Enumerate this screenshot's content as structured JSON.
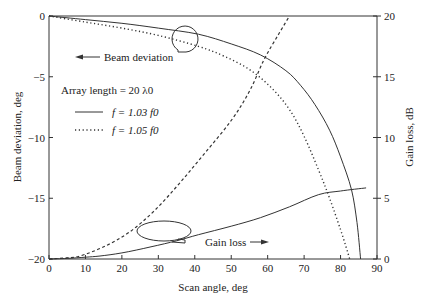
{
  "chart_data": {
    "type": "line",
    "title": "",
    "xlabel": "Scan angle, deg",
    "ylabel": "Beam deviation, deg",
    "y2label": "Gain loss, dB",
    "xlim": [
      0,
      90
    ],
    "ylim": [
      -20,
      0
    ],
    "y2lim": [
      0,
      20
    ],
    "xticks": [
      0,
      10,
      20,
      30,
      40,
      50,
      60,
      70,
      80,
      90
    ],
    "yticks": [
      0,
      -5,
      -10,
      -15,
      -20
    ],
    "y2ticks": [
      20,
      15,
      10,
      5,
      0
    ],
    "grid": false,
    "legend": {
      "title": "Array length = 20 λ0",
      "entries": [
        {
          "label": "f = 1.03 f0",
          "style": "solid"
        },
        {
          "label": "f = 1.05 f0",
          "style": "dotted"
        }
      ],
      "placement": "upper-left"
    },
    "annotations": [
      {
        "text": "Beam deviation",
        "arrow": "left",
        "refers_to": "left-axis"
      },
      {
        "text": "Gain loss",
        "arrow": "right",
        "refers_to": "right-axis"
      }
    ],
    "series": [
      {
        "name": "Beam deviation, f = 1.03 f0",
        "axis": "left",
        "style": "solid",
        "x": [
          0,
          10,
          20,
          30,
          41,
          50,
          58,
          65,
          69,
          73,
          77,
          80,
          83,
          84.5,
          85.5
        ],
        "y": [
          0,
          -0.3,
          -0.6,
          -1.0,
          -1.5,
          -2.3,
          -3.2,
          -4.5,
          -5.7,
          -7.3,
          -9.4,
          -11.6,
          -14.3,
          -17.0,
          -20.0
        ]
      },
      {
        "name": "Beam deviation, f = 1.05 f0",
        "axis": "left",
        "style": "dotted",
        "x": [
          0,
          10,
          20,
          30,
          41,
          48,
          55,
          61,
          66,
          70,
          74,
          77,
          80,
          81.5,
          82.5
        ],
        "y": [
          0,
          -0.5,
          -1.0,
          -1.6,
          -2.5,
          -3.3,
          -4.4,
          -5.9,
          -7.7,
          -9.9,
          -12.7,
          -15.0,
          -17.6,
          -19.0,
          -20.0
        ]
      },
      {
        "name": "Gain loss, f = 1.03 f0",
        "axis": "right",
        "style": "solid",
        "x": [
          0,
          5,
          10,
          14,
          20,
          28,
          35,
          41,
          50,
          58,
          66,
          74,
          80,
          87
        ],
        "y": [
          0,
          0.05,
          0.15,
          0.25,
          0.5,
          1.0,
          1.5,
          2.0,
          2.7,
          3.4,
          4.3,
          5.3,
          5.6,
          5.85
        ]
      },
      {
        "name": "Gain loss, f = 1.05 f0",
        "axis": "right",
        "style": "dashed",
        "x": [
          0,
          5,
          8.5,
          15,
          22,
          29,
          36,
          43,
          50,
          55,
          59,
          63,
          66
        ],
        "y": [
          0,
          0.1,
          0.25,
          1.0,
          2.2,
          4.0,
          6.3,
          8.8,
          11.4,
          13.8,
          16.4,
          18.5,
          20.0
        ]
      }
    ]
  }
}
